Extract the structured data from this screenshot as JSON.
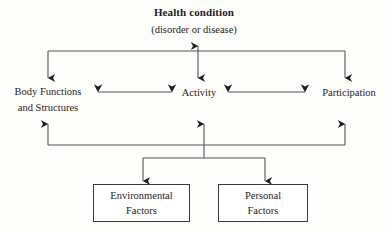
{
  "diagram": {
    "name": "ICF model of functioning and disability",
    "background_color": "#fdfdfb",
    "line_color": "#555555",
    "text_color": "#1d1d1d",
    "box_border_color": "#3a3a3a"
  },
  "health_condition": {
    "title": "Health condition",
    "subtitle": "(disorder or disease)"
  },
  "nodes": {
    "body_functions": {
      "line1": "Body Functions",
      "line2": "and Structures"
    },
    "activity": {
      "label": "Activity"
    },
    "participation": {
      "label": "Participation"
    }
  },
  "factor_boxes": [
    {
      "id": "environmental",
      "line1": "Environmental",
      "line2": "Factors"
    },
    {
      "id": "personal",
      "line1": "Personal",
      "line2": "Factors"
    }
  ],
  "connectors": {
    "top_bracket": "horizontal bar linking Health condition down to Body Functions, Activity and Participation",
    "center_vertical": "double-headed arrow between Health condition and Activity",
    "left_horizontal": "double-headed arrow between Body Functions and Structures and Activity",
    "right_horizontal": "double-headed arrow between Activity and Participation",
    "bottom_bracket": "horizontal bar with up arrows to Body Functions, Activity and Participation",
    "factors_split": "bar splitting down into Environmental Factors and Personal Factors"
  }
}
